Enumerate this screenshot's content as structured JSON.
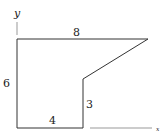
{
  "diagram": {
    "axes": {
      "y_label": "y",
      "x_label": "x"
    },
    "dimensions": {
      "top": "8",
      "left": "6",
      "inner_vertical": "3",
      "bottom": "4"
    },
    "colors": {
      "stroke": "#333333",
      "axis": "#999999",
      "text": "#222222"
    }
  }
}
